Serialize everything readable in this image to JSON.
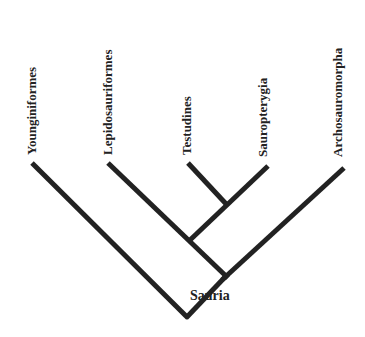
{
  "diagram": {
    "type": "cladogram",
    "line_color": "#222222",
    "taxa": [
      {
        "label": "Younginiformes"
      },
      {
        "label": "Lepidosauriformes"
      },
      {
        "label": "Testudines"
      },
      {
        "label": "Sauropterygia"
      },
      {
        "label": "Archosauromorpha"
      }
    ],
    "root_label": "Sauria",
    "topology": "(Younginiformes, ((Lepidosauriformes, (Testudines, Sauropterygia)), Archosauromorpha)) Sauria"
  }
}
